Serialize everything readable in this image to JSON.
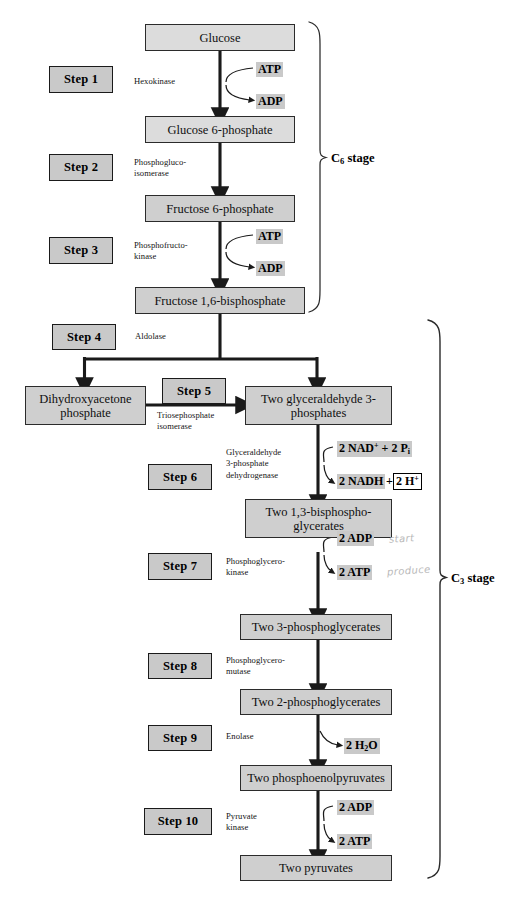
{
  "diagram": {
    "accent_gray": "#c9c9c9",
    "box_gray": "#cfcfcf",
    "line_color": "#1a1a1a"
  },
  "metabolites": [
    {
      "id": "glucose",
      "label": "Glucose"
    },
    {
      "id": "g6p",
      "label": "Glucose 6-phosphate"
    },
    {
      "id": "f6p",
      "label": "Fructose 6-phosphate"
    },
    {
      "id": "f16bp",
      "label": "Fructose 1,6-bisphosphate"
    },
    {
      "id": "dhap",
      "label": "Dihydroxyacetone phosphate"
    },
    {
      "id": "g3p",
      "label": "Two glyceraldehyde 3-phosphates"
    },
    {
      "id": "bpg",
      "label": "Two 1,3-bisphospho- glycerates"
    },
    {
      "id": "pg3",
      "label": "Two 3-phosphoglycerates"
    },
    {
      "id": "pg2",
      "label": "Two 2-phosphoglycerates"
    },
    {
      "id": "pep",
      "label": "Two phosphoenolpyruvates"
    },
    {
      "id": "pyruvate",
      "label": "Two pyruvates"
    }
  ],
  "steps": [
    {
      "id": "step1",
      "label": "Step 1"
    },
    {
      "id": "step2",
      "label": "Step 2"
    },
    {
      "id": "step3",
      "label": "Step 3"
    },
    {
      "id": "step4",
      "label": "Step 4"
    },
    {
      "id": "step5",
      "label": "Step 5"
    },
    {
      "id": "step6",
      "label": "Step 6"
    },
    {
      "id": "step7",
      "label": "Step 7"
    },
    {
      "id": "step8",
      "label": "Step 8"
    },
    {
      "id": "step9",
      "label": "Step 9"
    },
    {
      "id": "step10",
      "label": "Step 10"
    }
  ],
  "enzymes": [
    {
      "id": "hexokinase",
      "label": "Hexokinase"
    },
    {
      "id": "pgi",
      "label": "Phosphogluco-\nisomerase"
    },
    {
      "id": "pfk",
      "label": "Phosphofructo-\nkinase"
    },
    {
      "id": "aldolase",
      "label": "Aldolase"
    },
    {
      "id": "tpi",
      "label": "Triosephosphate\nisomerase"
    },
    {
      "id": "gapdh",
      "label": "Glyceraldehyde\n3-phosphate\ndehydrogenase"
    },
    {
      "id": "pgk",
      "label": "Phosphoglycero-\nkinase"
    },
    {
      "id": "pgm",
      "label": "Phosphoglycero-\nmutase"
    },
    {
      "id": "enolase",
      "label": "Enolase"
    },
    {
      "id": "pyr_kinase",
      "label": "Pyruvate\nkinase"
    }
  ],
  "cofactors": {
    "atp1": "ATP",
    "adp1": "ADP",
    "atp3": "ATP",
    "adp3": "ADP",
    "nad": "2 NAD",
    "nad_sup": "+",
    "nad_plus_pi": " + 2 P",
    "pi_sub": "i",
    "nadh": "2 NADH",
    "nadh_plus": "+",
    "h_plus": "2 H",
    "h_sup": "+",
    "adp7": "2 ADP",
    "atp7": "2 ATP",
    "h2o": "2 H",
    "h2o_sub": "2",
    "h2o_tail": "O",
    "adp10": "2 ADP",
    "atp10": "2 ATP"
  },
  "stages": [
    {
      "id": "c6",
      "prefix": "C",
      "sub": "6",
      "suffix": " stage"
    },
    {
      "id": "c3",
      "prefix": "C",
      "sub": "3",
      "suffix": " stage"
    }
  ],
  "annotations": [
    {
      "id": "ann_start",
      "text": "start"
    },
    {
      "id": "ann_produce",
      "text": "produce"
    }
  ]
}
